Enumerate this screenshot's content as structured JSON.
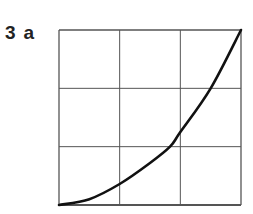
{
  "figure": {
    "number": "3",
    "sublabel": "a"
  },
  "chart_data": {
    "type": "line",
    "title": "",
    "xlabel": "",
    "ylabel": "",
    "grid": true,
    "grid_divisions": {
      "x": 3,
      "y": 3
    },
    "xlim": [
      0,
      3
    ],
    "ylim": [
      0,
      3
    ],
    "series": [
      {
        "name": "curve",
        "x": [
          0,
          0.5,
          1,
          1.5,
          1.83,
          2,
          2.5,
          3
        ],
        "y": [
          0,
          0.1,
          0.36,
          0.72,
          1,
          1.25,
          2,
          3
        ]
      }
    ],
    "colors": {
      "grid": "#555555",
      "line": "#111111"
    }
  }
}
